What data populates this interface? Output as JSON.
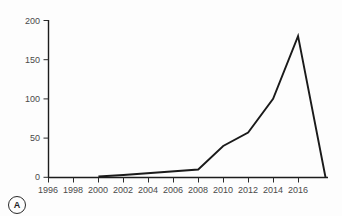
{
  "figure": {
    "panel_label": "A",
    "background_color": "#fdfdfd",
    "line_color": "#1a1a1a",
    "axis_color": "#1c1c1c",
    "tick_label_color": "#4a4a4a"
  },
  "chart_data": {
    "type": "line",
    "title": "",
    "subtitle": "",
    "xlabel": "",
    "ylabel": "",
    "xlim": [
      1996,
      1998.4
    ],
    "ylim": [
      0,
      200
    ],
    "grid": false,
    "legend": "none",
    "x_ticks": [
      1996,
      1998,
      2000,
      2002,
      2004,
      2006,
      2008,
      2010,
      2012,
      2014,
      2016
    ],
    "x_tick_labels": [
      "1996",
      "1998",
      "2000",
      "2002",
      "2004",
      "2006",
      "2008",
      "2010",
      "2012",
      "2014",
      "2016"
    ],
    "y_ticks": [
      0,
      50,
      100,
      150,
      200
    ],
    "y_tick_labels": [
      "0",
      "50",
      "100",
      "150",
      "200"
    ],
    "x_axis_range": [
      1996,
      2018.4
    ],
    "y_axis_range": [
      0,
      200
    ],
    "series": [
      {
        "name": "count",
        "x": [
          2000,
          2002,
          2008,
          2010,
          2012,
          2014,
          2016,
          2018.2
        ],
        "values": [
          1,
          3,
          10,
          40,
          57,
          100,
          180,
          0
        ]
      }
    ]
  }
}
